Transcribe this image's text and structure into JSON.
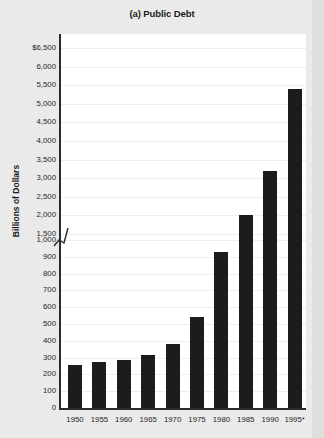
{
  "chart_data": {
    "type": "bar",
    "title": "(a) Public Debt",
    "xlabel": "",
    "ylabel": "Billions of Dollars",
    "categories": [
      "1950",
      "1955",
      "1960",
      "1965",
      "1970",
      "1975",
      "1980",
      "1985",
      "1990",
      "1995*"
    ],
    "values": [
      257,
      274,
      286,
      317,
      381,
      542,
      930,
      2000,
      3200,
      5400
    ],
    "ytick_labels": [
      "$6,500",
      "6,000",
      "5,500",
      "5,000",
      "4,500",
      "4,000",
      "3,500",
      "3,000",
      "2,500",
      "2,000",
      "1,500",
      "1,000",
      "900",
      "800",
      "700",
      "600",
      "500",
      "400",
      "300",
      "200",
      "100",
      "0"
    ],
    "ytick_values": [
      6500,
      6000,
      5500,
      5000,
      4500,
      4000,
      3500,
      3000,
      2500,
      2000,
      1500,
      1000,
      900,
      800,
      700,
      600,
      500,
      400,
      300,
      200,
      100,
      0
    ],
    "axis_break": {
      "between": [
        1500,
        1000
      ],
      "symbol": "zigzag"
    },
    "grid": true,
    "legend": "none",
    "bar_color": "#1c1c1c",
    "background_color": "#ffffff",
    "footnote_marker": "*"
  }
}
